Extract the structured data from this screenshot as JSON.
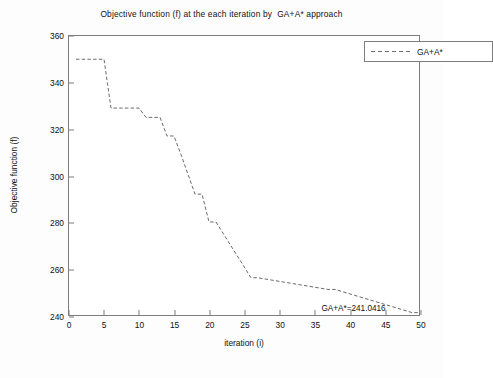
{
  "chart_data": {
    "type": "line",
    "title": "Objective function (f) at the each iteration by  GA+A* approach",
    "xlabel": "iteration (i)",
    "ylabel": "Objective function (f)",
    "xlim": [
      0,
      50
    ],
    "ylim": [
      240,
      360
    ],
    "xticks": [
      0,
      5,
      10,
      15,
      20,
      25,
      30,
      35,
      40,
      45,
      50
    ],
    "yticks": [
      240,
      260,
      280,
      300,
      320,
      340,
      360
    ],
    "grid": false,
    "legend": {
      "position": "top-right",
      "entries": [
        "GA+A*"
      ]
    },
    "series": [
      {
        "name": "GA+A*",
        "linestyle": "dashed",
        "color": "#6b6b6b",
        "x": [
          1,
          5,
          6,
          10,
          11,
          13,
          14,
          15,
          16,
          18,
          19,
          20,
          21,
          26,
          27,
          37,
          38,
          49,
          50
        ],
        "y": [
          350,
          350,
          349,
          329,
          329,
          325,
          325,
          317,
          317,
          309,
          309,
          292,
          292,
          280,
          280,
          256,
          256,
          251,
          251
        ],
        "values": [
          350,
          350,
          329,
          329,
          325,
          325,
          317,
          317,
          309,
          292,
          292,
          280,
          280,
          256,
          256,
          251,
          251,
          241.0416,
          241.0416
        ]
      }
    ],
    "annotations": [
      {
        "text": "GA+A*=241.0416",
        "x": 36,
        "y": 241.0416
      }
    ]
  }
}
